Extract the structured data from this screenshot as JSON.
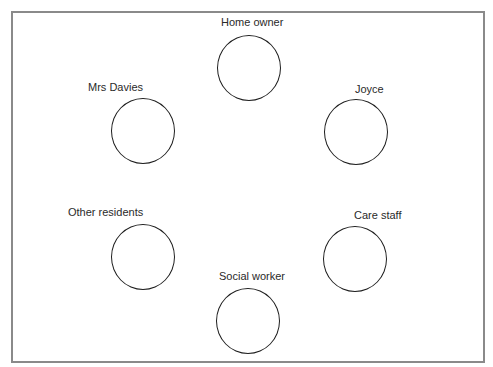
{
  "diagram": {
    "type": "relationship-map",
    "nodes": [
      {
        "id": "home-owner",
        "label": "Home owner"
      },
      {
        "id": "mrs-davies",
        "label": "Mrs Davies"
      },
      {
        "id": "joyce",
        "label": "Joyce"
      },
      {
        "id": "other-residents",
        "label": "Other residents"
      },
      {
        "id": "care-staff",
        "label": "Care staff"
      },
      {
        "id": "social-worker",
        "label": "Social worker"
      }
    ]
  },
  "colors": {
    "frame_border": "#8a8a8a",
    "circle_stroke": "#1e1e1e",
    "label_text": "#2a2a2a",
    "background": "#ffffff"
  }
}
